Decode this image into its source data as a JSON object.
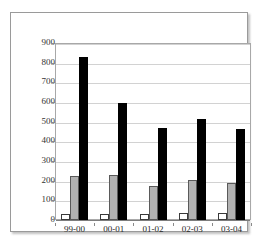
{
  "chart_data": {
    "type": "bar",
    "title": "",
    "subtitle": "",
    "xlabel": "",
    "ylabel": "",
    "categories": [
      "99-00",
      "00-01",
      "01-02",
      "02-03",
      "03-04"
    ],
    "series": [
      {
        "name": "series-1",
        "color": "#ffffff",
        "values": [
          28,
          32,
          30,
          36,
          34
        ]
      },
      {
        "name": "series-2",
        "color": "#b2b2b2",
        "values": [
          224,
          228,
          175,
          205,
          190
        ]
      },
      {
        "name": "series-3",
        "color": "#000000",
        "values": [
          830,
          597,
          470,
          513,
          465
        ]
      }
    ],
    "ylim": [
      0,
      900
    ],
    "ytick_step": 100,
    "yticks": [
      "900",
      "800",
      "700",
      "600",
      "500",
      "400",
      "300",
      "200",
      "100",
      "0"
    ],
    "grid": true,
    "legend": "none",
    "frame": true
  }
}
